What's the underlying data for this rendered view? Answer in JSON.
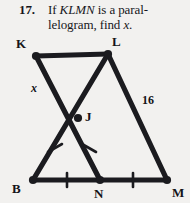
{
  "problem": {
    "number": "17.",
    "line1_prefix": "If ",
    "line1_italic": "KLMN",
    "line1_suffix": " is a paral-",
    "line2_prefix": "lelogram, find ",
    "line2_italic": "x",
    "line2_suffix": "."
  },
  "figure": {
    "vertex_labels": {
      "K": "K",
      "L": "L",
      "J": "J",
      "B": "B",
      "N": "N",
      "M": "M"
    },
    "measure_labels": {
      "side_x": "x",
      "side_16": "16"
    },
    "colors": {
      "ink": "#1b1b1f",
      "paper": "#f2f1ef"
    }
  }
}
